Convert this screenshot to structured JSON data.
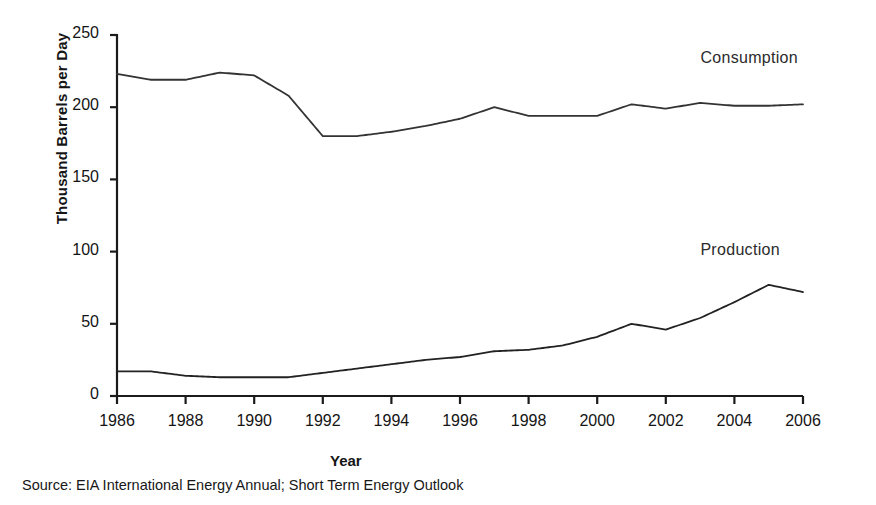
{
  "chart_data": {
    "type": "line",
    "title": "",
    "xlabel": "Year",
    "ylabel": "Thousand Barrels per Day",
    "xlim": [
      1986,
      2006
    ],
    "ylim": [
      0,
      250
    ],
    "yticks": [
      0,
      50,
      100,
      150,
      200,
      250
    ],
    "xticks": [
      1986,
      1988,
      1990,
      1992,
      1994,
      1996,
      1998,
      2000,
      2002,
      2004,
      2006
    ],
    "xtick_labels": [
      "1986",
      "1988",
      "1990",
      "1992",
      "1994",
      "1996",
      "1998",
      "2000",
      "2002",
      "2004",
      "2006"
    ],
    "ytick_labels": [
      "0",
      "50",
      "100",
      "150",
      "200",
      "250"
    ],
    "grid": false,
    "legend_position": "inline-right",
    "x": [
      1986,
      1987,
      1988,
      1989,
      1990,
      1991,
      1992,
      1993,
      1994,
      1995,
      1996,
      1997,
      1998,
      1999,
      2000,
      2001,
      2002,
      2003,
      2004,
      2005,
      2006
    ],
    "series": [
      {
        "name": "Consumption",
        "color": "#333333",
        "values": [
          223,
          219,
          219,
          224,
          222,
          208,
          180,
          180,
          183,
          187,
          192,
          200,
          194,
          194,
          194,
          202,
          199,
          203,
          201,
          201,
          202
        ],
        "label_x": 2004,
        "label_y": 233
      },
      {
        "name": "Production",
        "color": "#222222",
        "values": [
          17,
          17,
          14,
          13,
          13,
          13,
          16,
          19,
          22,
          25,
          27,
          31,
          32,
          35,
          41,
          50,
          46,
          54,
          65,
          77,
          72
        ],
        "label_x": 2004,
        "label_y": 100
      }
    ],
    "source_note": "Source: EIA International Energy Annual; Short Term Energy Outlook"
  },
  "axes": {
    "ylabel": "Thousand Barrels per Day",
    "xlabel": "Year"
  },
  "labels": {
    "consumption": "Consumption",
    "production": "Production"
  },
  "footer": {
    "source": "Source: EIA International Energy Annual; Short Term Energy Outlook"
  }
}
